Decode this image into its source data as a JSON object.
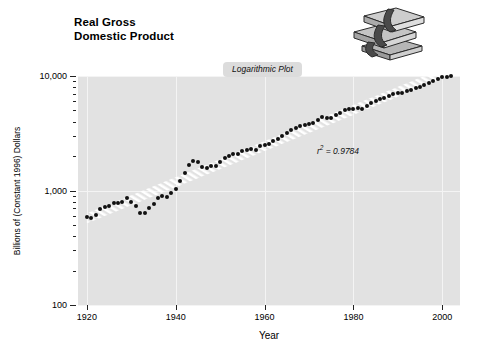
{
  "title": {
    "line1": "Real Gross",
    "line2": "Domestic Product"
  },
  "callout": {
    "label": "Logarithmic Plot"
  },
  "annotation": {
    "r_squared_prefix": "r",
    "r_squared_exponent": "2",
    "r_squared_value": " = 0.9784",
    "r_squared_full": "r2 = 0.9784"
  },
  "illustration": {
    "name": "stack-of-money-icon",
    "description": "grayscale stack of banded cash bundles"
  },
  "colors": {
    "plot_background": "#e2e2e2",
    "page_background": "#ffffff",
    "point": "#111111",
    "gridline": "#f4f4f4",
    "callout_background": "#dcdcdc",
    "trend_stripe": "#ffffff"
  },
  "chart_data": {
    "type": "scatter",
    "title": "Real Gross Domestic Product",
    "subtitle": "Logarithmic Plot",
    "xlabel": "Year",
    "ylabel": "Billions of (Constant 1996) Dollars",
    "yscale": "log",
    "xlim": [
      1918,
      2004
    ],
    "ylim": [
      100,
      10000
    ],
    "ytick_labels": [
      "100",
      "1,000",
      "10,000"
    ],
    "ytick_values": [
      100,
      1000,
      10000
    ],
    "xtick_labels": [
      "1920",
      "1940",
      "1960",
      "1980",
      "2000"
    ],
    "xtick_values": [
      1920,
      1940,
      1960,
      1980,
      2000
    ],
    "grid": true,
    "legend": "none",
    "annotations": [
      "r2 = 0.9784"
    ],
    "trendline": {
      "style": "white-hatched-band",
      "r_squared": 0.9784
    },
    "series": [
      {
        "name": "Real GDP",
        "x": [
          1920,
          1921,
          1922,
          1923,
          1924,
          1925,
          1926,
          1927,
          1928,
          1929,
          1930,
          1931,
          1932,
          1933,
          1934,
          1935,
          1936,
          1937,
          1938,
          1939,
          1940,
          1941,
          1942,
          1943,
          1944,
          1945,
          1946,
          1947,
          1948,
          1949,
          1950,
          1951,
          1952,
          1953,
          1954,
          1955,
          1956,
          1957,
          1958,
          1959,
          1960,
          1961,
          1962,
          1963,
          1964,
          1965,
          1966,
          1967,
          1968,
          1969,
          1970,
          1971,
          1972,
          1973,
          1974,
          1975,
          1976,
          1977,
          1978,
          1979,
          1980,
          1981,
          1982,
          1983,
          1984,
          1985,
          1986,
          1987,
          1988,
          1989,
          1990,
          1991,
          1992,
          1993,
          1994,
          1995,
          1996,
          1997,
          1998,
          1999,
          2000,
          2001,
          2002
        ],
        "y": [
          590,
          576,
          608,
          689,
          711,
          727,
          775,
          782,
          790,
          865,
          786,
          735,
          640,
          630,
          699,
          761,
          860,
          904,
          873,
          944,
          1025,
          1207,
          1432,
          1672,
          1806,
          1786,
          1589,
          1574,
          1643,
          1634,
          1777,
          1915,
          1988,
          2080,
          2065,
          2213,
          2256,
          2301,
          2279,
          2441,
          2502,
          2560,
          2715,
          2834,
          2999,
          3192,
          3400,
          3484,
          3653,
          3766,
          3772,
          3899,
          4105,
          4342,
          4320,
          4311,
          4541,
          4751,
          5015,
          5173,
          5162,
          5292,
          5189,
          5424,
          5814,
          6054,
          6264,
          6475,
          6743,
          6981,
          7113,
          7101,
          7337,
          7533,
          7836,
          8032,
          8329,
          8704,
          9067,
          9470,
          9817,
          9891,
          10075
        ]
      }
    ]
  }
}
